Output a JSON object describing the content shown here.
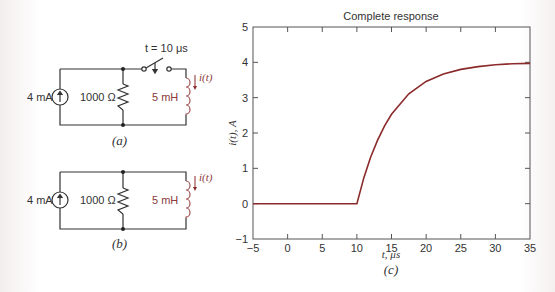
{
  "circuit_a": {
    "source_label": "4 mA",
    "resistor_label": "1000 Ω",
    "inductor_label": "5 mH",
    "current_label": "i(t)",
    "switch_label": "t = 10 μs",
    "caption": "(a)"
  },
  "circuit_b": {
    "source_label": "4 mA",
    "resistor_label": "1000 Ω",
    "inductor_label": "5 mH",
    "current_label": "i(t)",
    "caption": "(b)"
  },
  "colors": {
    "wire": "#333333",
    "curve": "#8b2a2a",
    "inductor": "#a05050",
    "axis": "#555555"
  },
  "chart_data": {
    "type": "line",
    "title": "Complete response",
    "xlabel": "t, μs",
    "ylabel": "i(t), A",
    "caption": "(c)",
    "xlim": [
      -5,
      35
    ],
    "ylim": [
      -1,
      5
    ],
    "x_ticks": [
      -5,
      0,
      5,
      10,
      15,
      20,
      25,
      30,
      35
    ],
    "y_ticks": [
      -1,
      0,
      1,
      2,
      3,
      4,
      5
    ],
    "grid": false,
    "legend": null,
    "series": [
      {
        "name": "i(t)",
        "x": [
          -5,
          0,
          5,
          10,
          11,
          12,
          13,
          14,
          15,
          17.5,
          20,
          22.5,
          25,
          27.5,
          30,
          32.5,
          35
        ],
        "values": [
          0,
          0,
          0,
          0,
          0.73,
          1.32,
          1.8,
          2.2,
          2.53,
          3.11,
          3.46,
          3.67,
          3.8,
          3.88,
          3.93,
          3.96,
          3.97
        ]
      }
    ]
  }
}
